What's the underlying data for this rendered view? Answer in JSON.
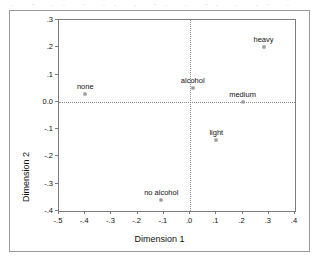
{
  "chart_data": {
    "type": "scatter",
    "title": "",
    "xlabel": "Dimension 1",
    "ylabel": "Dimension 2",
    "xlim": [
      -0.5,
      0.4
    ],
    "ylim": [
      -0.4,
      0.3
    ],
    "grid": false,
    "reference_lines": {
      "x": 0.0,
      "y": 0.0,
      "style": "dotted"
    },
    "xticks": [
      "-.5",
      "-.4",
      "-.3",
      "-.2",
      "-.1",
      ".0",
      ".1",
      ".2",
      ".3",
      ".4"
    ],
    "xtickvalues": [
      -0.5,
      -0.4,
      -0.3,
      -0.2,
      -0.1,
      0.0,
      0.1,
      0.2,
      0.3,
      0.4
    ],
    "yticks": [
      ".3",
      ".2",
      ".1",
      "0.0",
      "-.1",
      "-.2",
      "-.3",
      "-.4"
    ],
    "ytickvalues": [
      0.3,
      0.2,
      0.1,
      0.0,
      -0.1,
      -0.2,
      -0.3,
      -0.4
    ],
    "points": [
      {
        "label": "none",
        "x": -0.4,
        "y": 0.03,
        "label_dx": 0,
        "label_dy": -11
      },
      {
        "label": "alcohol",
        "x": 0.01,
        "y": 0.05,
        "label_dx": 0,
        "label_dy": -11
      },
      {
        "label": "heavy",
        "x": 0.28,
        "y": 0.2,
        "label_dx": 0,
        "label_dy": -11
      },
      {
        "label": "medium",
        "x": 0.2,
        "y": 0.0,
        "label_dx": 0,
        "label_dy": -11
      },
      {
        "label": "light",
        "x": 0.1,
        "y": -0.14,
        "label_dx": 0,
        "label_dy": -11
      },
      {
        "label": "no alcohol",
        "x": -0.11,
        "y": -0.36,
        "label_dx": 0,
        "label_dy": -11
      }
    ]
  },
  "figure": {
    "border_color": "#9a9a9a",
    "axis_color": "#7d7d7d",
    "marker_color": "#7a7a7a",
    "text_color": "#111111",
    "reference_line_color": "#8e8e8e"
  }
}
